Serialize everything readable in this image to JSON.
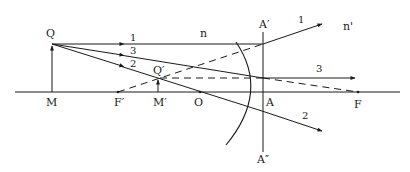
{
  "diagram": {
    "media": {
      "incident": "n",
      "refracted": "n'"
    },
    "points": {
      "Q": "Q",
      "M": "M",
      "F_prime": "F′",
      "M_prime": "M′",
      "Q_prime": "Q′",
      "O": "O",
      "A": "A",
      "F": "F",
      "A_prime": "A′",
      "A_double_prime": "A″"
    },
    "rays": {
      "ray1": "1",
      "ray2": "2",
      "ray3": "3",
      "ray1_out": "1",
      "ray2_out": "2",
      "ray3_out": "3"
    },
    "colors": {
      "line": "#1a1a1a",
      "background": "#ffffff"
    }
  }
}
